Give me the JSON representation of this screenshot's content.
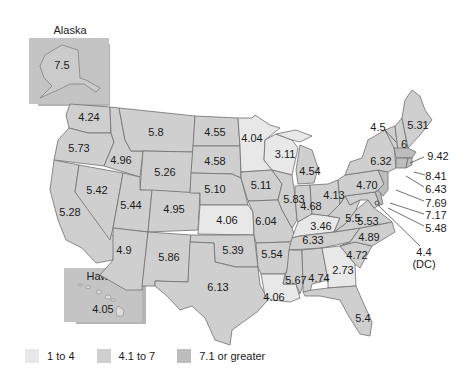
{
  "colors": {
    "low": "#e8e8e8",
    "mid": "#cfcfcf",
    "high": "#bdbdbd",
    "border": "#6e6e6e",
    "shadow": "#b0b0b0"
  },
  "insets": {
    "alaska": {
      "title": "Alaska",
      "value": "7.5"
    },
    "hawaii": {
      "title": "Hawaii",
      "value": "4.05"
    }
  },
  "legend": [
    {
      "label": "1 to 4",
      "swatch": "low"
    },
    {
      "label": "4.1 to 7",
      "swatch": "mid"
    },
    {
      "label": "7.1 or greater",
      "swatch": "high"
    }
  ],
  "states": {
    "WA": "4.24",
    "OR": "5.73",
    "CA": "5.28",
    "ID": "4.96",
    "NV": "5.42",
    "MT": "5.8",
    "WY": "5.26",
    "UT": "5.44",
    "AZ": "4.9",
    "CO": "4.95",
    "NM": "5.86",
    "ND": "4.55",
    "SD": "4.58",
    "NE": "5.10",
    "KS": "4.06",
    "OK": "5.39",
    "TX": "6.13",
    "MN": "4.04",
    "IA": "5.11",
    "MO": "6.04",
    "AR": "5.54",
    "LA": "4.06",
    "WI": "3.11",
    "IL": "5.83",
    "MI": "4.54",
    "IN": "4.68",
    "OH": "4.13",
    "KY": "3.46",
    "TN": "6.33",
    "MS": "5.67",
    "AL": "4.74",
    "GA": "2.73",
    "FL": "5.4",
    "SC": "4.72",
    "NC": "4.89",
    "VA": "5.53",
    "WV": "5.5",
    "PA": "4.70",
    "NY": "6.32",
    "VT": "4.5",
    "NH": "6",
    "ME": "5.31",
    "MA": "9.42",
    "CT": "8.41",
    "NJ": "6.43",
    "DE": "7.69",
    "MD": "7.17",
    "RI_note": "5.48",
    "DC": "4.4",
    "DC_label": "(DC)"
  },
  "callouts": {
    "VT": "4.5",
    "MA": "9.42",
    "RI": "8.41",
    "CT": "6.43",
    "NJ": "7.69",
    "DE": "7.17",
    "MD": "5.48",
    "DC": "4.4",
    "DC_label": "(DC)"
  }
}
